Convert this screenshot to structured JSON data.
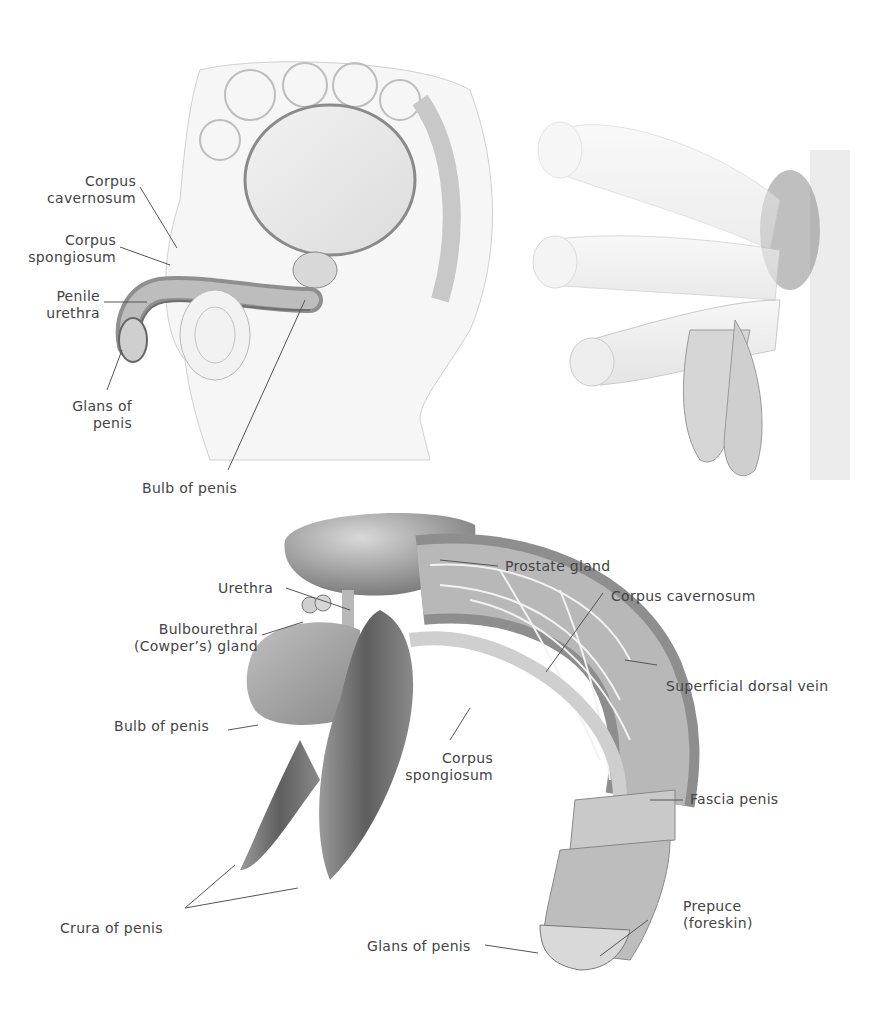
{
  "figure": {
    "panels": [
      {
        "id": "sagittal-section",
        "labels": [
          {
            "text": "Corpus\ncavernosum",
            "lines": [
              "Corpus",
              "cavernosum"
            ]
          },
          {
            "text": "Corpus\nspongiosum",
            "lines": [
              "Corpus",
              "spongiosum"
            ]
          },
          {
            "text": "Penile\nurethra",
            "lines": [
              "Penile",
              "urethra"
            ]
          },
          {
            "text": "Glans of\npenis",
            "lines": [
              "Glans of",
              "penis"
            ]
          },
          {
            "text": "Bulb of penis",
            "lines": [
              "Bulb of penis"
            ]
          }
        ]
      },
      {
        "id": "external-view",
        "labels": []
      },
      {
        "id": "internal-structures",
        "labels": [
          {
            "lines": [
              "Prostate gland"
            ]
          },
          {
            "lines": [
              "Urethra"
            ]
          },
          {
            "lines": [
              "Bulbourethral",
              "(Cowper’s) gland"
            ]
          },
          {
            "lines": [
              "Corpus cavernosum"
            ]
          },
          {
            "lines": [
              "Superficial dorsal vein"
            ]
          },
          {
            "lines": [
              "Bulb of penis"
            ]
          },
          {
            "lines": [
              "Corpus",
              "spongiosum"
            ]
          },
          {
            "lines": [
              "Fascia penis"
            ]
          },
          {
            "lines": [
              "Prepuce",
              "(foreskin)"
            ]
          },
          {
            "lines": [
              "Crura of penis"
            ]
          },
          {
            "lines": [
              "Glans of penis"
            ]
          }
        ]
      }
    ]
  },
  "colors": {
    "background": "#ffffff",
    "label_text": "#444444",
    "leader_line": "#555555",
    "tissue_light": "#e6e6e6",
    "tissue_mid": "#b5b5b5",
    "tissue_dark": "#7a7a7a"
  }
}
